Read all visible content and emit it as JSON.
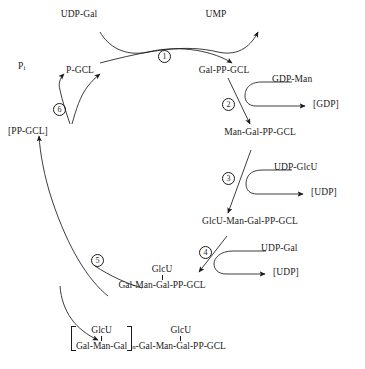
{
  "diagram": {
    "type": "biochemical-pathway-cycle",
    "stroke_color": "#1a1a1a",
    "background_color": "#ffffff"
  },
  "steps": [
    {
      "id": "1",
      "number": "1"
    },
    {
      "id": "2",
      "number": "2"
    },
    {
      "id": "3",
      "number": "3"
    },
    {
      "id": "4",
      "number": "4"
    },
    {
      "id": "5",
      "number": "5"
    },
    {
      "id": "6",
      "number": "6"
    }
  ],
  "species": {
    "udp_gal_top": "UDP-Gal",
    "ump": "UMP",
    "p_gcl": "P-GCL",
    "pi": "P",
    "pi_sub": "i",
    "gal_pp_gcl": "Gal-PP-GCL",
    "gdp_man": "GDP-Man",
    "gdp_released": "[GDP]",
    "man_gal_pp_gcl": "Man-Gal-PP-GCL",
    "udp_glcu": "UDP-GlcU",
    "udp_released_1": "[UDP]",
    "glcu_man_gal_pp_gcl": "GlcU-Man-Gal-PP-GCL",
    "udp_gal_step4": "UDP-Gal",
    "udp_released_2": "[UDP]",
    "pp_gcl": "[PP-GCL]",
    "repeat_branch": "GlcU",
    "repeat_backbone": "Gal-Man-Gal-PP-GCL",
    "polymer_branch_inner": "GlcU",
    "polymer_backbone_inner": "Gal-Man-Gal",
    "polymer_subscript": "n",
    "polymer_branch_tail": "GlcU",
    "polymer_backbone_tail": "-Gal-Man-Gal-PP-GCL"
  }
}
